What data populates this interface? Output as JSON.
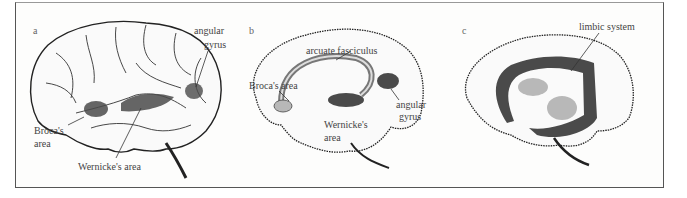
{
  "figure": {
    "panels": [
      {
        "letter": "a",
        "view": "lateral",
        "labels": {
          "angular_1": "angular",
          "angular_2": "gyrus",
          "broca_1": "Broca's",
          "broca_2": "area",
          "wernicke": "Wernicke's area"
        }
      },
      {
        "letter": "b",
        "view": "medial-connections",
        "labels": {
          "arcuate": "arcuate fasciculus",
          "broca": "Broca's area",
          "angular_1": "angular",
          "angular_2": "gyrus",
          "wernicke_1": "Wernicke's",
          "wernicke_2": "area"
        }
      },
      {
        "letter": "c",
        "view": "medial",
        "labels": {
          "limbic": "limbic system"
        }
      }
    ],
    "colors": {
      "region_dark": "#4a4a4a",
      "region_light": "#b8b8b8",
      "outline": "#222222",
      "text": "#444444"
    }
  }
}
